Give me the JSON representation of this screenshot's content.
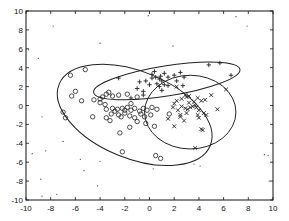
{
  "chart_data": {
    "type": "scatter",
    "title": "",
    "xlabel": "",
    "ylabel": "",
    "xlim": [
      -10,
      10
    ],
    "ylim": [
      -10,
      10
    ],
    "xticks": [
      "-10",
      "-8",
      "-6",
      "-4",
      "-2",
      "0",
      "2",
      "4",
      "6",
      "8",
      "10"
    ],
    "yticks": [
      "-10",
      "-8",
      "-6",
      "-4",
      "-2",
      "0",
      "2",
      "4",
      "6",
      "8",
      "10"
    ],
    "grid": false,
    "legend": null,
    "series": [
      {
        "name": "cluster-circles",
        "marker": "o",
        "points": [
          [
            -6.4,
            3.2
          ],
          [
            -5.2,
            3.8
          ],
          [
            -6.0,
            1.5
          ],
          [
            -6.3,
            1.0
          ],
          [
            -5.5,
            0.5
          ],
          [
            -7.0,
            -0.7
          ],
          [
            -4.5,
            0.6
          ],
          [
            -4.0,
            0.7
          ],
          [
            -3.8,
            0.9
          ],
          [
            -3.5,
            1.2
          ],
          [
            -3.3,
            1.4
          ],
          [
            -3.0,
            1.0
          ],
          [
            -2.5,
            1.1
          ],
          [
            -1.8,
            1.2
          ],
          [
            -1.5,
            0.2
          ],
          [
            -1.0,
            0.9
          ],
          [
            -4.0,
            0.3
          ],
          [
            -3.6,
            0.1
          ],
          [
            -3.5,
            -0.4
          ],
          [
            -3.0,
            -0.3
          ],
          [
            -2.8,
            -0.6
          ],
          [
            -2.6,
            -0.4
          ],
          [
            -2.2,
            -0.3
          ],
          [
            -2.0,
            -0.5
          ],
          [
            -1.8,
            -0.2
          ],
          [
            -1.5,
            -0.5
          ],
          [
            -1.2,
            -0.3
          ],
          [
            -0.8,
            -0.6
          ],
          [
            -0.5,
            -0.3
          ],
          [
            -0.2,
            -0.5
          ],
          [
            0.2,
            -0.2
          ],
          [
            0.6,
            -0.4
          ],
          [
            -3.1,
            -0.9
          ],
          [
            -2.5,
            -1.0
          ],
          [
            -2.3,
            -1.2
          ],
          [
            -2.0,
            -0.8
          ],
          [
            -1.6,
            -1.1
          ],
          [
            -1.2,
            -1.3
          ],
          [
            -0.7,
            -0.9
          ],
          [
            -0.4,
            -1.2
          ],
          [
            0.1,
            -1.0
          ],
          [
            -3.5,
            -1.3
          ],
          [
            -3.2,
            -1.6
          ],
          [
            -2.4,
            -2.9
          ],
          [
            -1.6,
            -2.3
          ],
          [
            -1.0,
            -1.7
          ],
          [
            -0.3,
            -1.9
          ],
          [
            0.4,
            -2.2
          ],
          [
            -4.6,
            -1.2
          ],
          [
            -2.2,
            -4.9
          ],
          [
            0.5,
            -5.3
          ],
          [
            0.9,
            -5.6
          ],
          [
            1.6,
            -0.9
          ],
          [
            -6.8,
            -1.3
          ]
        ]
      },
      {
        "name": "cluster-plus",
        "marker": "+",
        "points": [
          [
            -2.5,
            2.9
          ],
          [
            -1.0,
            1.8
          ],
          [
            -0.5,
            1.5
          ],
          [
            -0.3,
            2.6
          ],
          [
            0.0,
            2.2
          ],
          [
            0.2,
            2.9
          ],
          [
            0.5,
            3.0
          ],
          [
            0.8,
            2.8
          ],
          [
            1.0,
            2.6
          ],
          [
            0.6,
            2.3
          ],
          [
            0.8,
            2.0
          ],
          [
            1.2,
            2.2
          ],
          [
            -0.8,
            2.5
          ],
          [
            -0.5,
            1.1
          ],
          [
            -1.5,
            0.8
          ],
          [
            1.5,
            3.0
          ],
          [
            2.0,
            3.2
          ],
          [
            2.5,
            3.5
          ],
          [
            2.7,
            2.1
          ],
          [
            0.2,
            3.3
          ],
          [
            0.4,
            3.6
          ],
          [
            1.2,
            3.4
          ],
          [
            0.9,
            3.1
          ],
          [
            4.8,
            4.3
          ],
          [
            5.7,
            4.5
          ],
          [
            6.6,
            3.2
          ],
          [
            2.8,
            3.0
          ],
          [
            2.2,
            2.6
          ],
          [
            1.5,
            2.1
          ],
          [
            1.0,
            1.6
          ]
        ]
      },
      {
        "name": "cluster-x",
        "marker": "x",
        "points": [
          [
            1.9,
            -0.2
          ],
          [
            2.2,
            0.5
          ],
          [
            2.6,
            0.7
          ],
          [
            2.9,
            1.1
          ],
          [
            3.0,
            0.9
          ],
          [
            3.2,
            1.0
          ],
          [
            3.6,
            0.4
          ],
          [
            3.9,
            0.8
          ],
          [
            4.2,
            0.5
          ],
          [
            4.5,
            0.6
          ],
          [
            5.0,
            1.1
          ],
          [
            5.5,
            -0.4
          ],
          [
            2.0,
            0.2
          ],
          [
            2.3,
            -0.5
          ],
          [
            2.6,
            -0.1
          ],
          [
            2.9,
            -0.3
          ],
          [
            3.1,
            -0.4
          ],
          [
            3.3,
            -0.2
          ],
          [
            3.5,
            -0.1
          ],
          [
            3.8,
            -0.2
          ],
          [
            4.0,
            -0.5
          ],
          [
            4.4,
            -0.8
          ],
          [
            4.6,
            -1.0
          ],
          [
            3.0,
            -0.8
          ],
          [
            2.5,
            -1.0
          ],
          [
            1.5,
            -1.4
          ],
          [
            2.5,
            -1.2
          ],
          [
            2.8,
            -1.6
          ],
          [
            2.0,
            -2.2
          ],
          [
            3.9,
            -1.0
          ],
          [
            4.0,
            -1.3
          ],
          [
            4.2,
            -2.5
          ],
          [
            4.3,
            -2.6
          ],
          [
            3.7,
            -4.5
          ],
          [
            3.7,
            0.0
          ],
          [
            2.2,
            2.0
          ],
          [
            6.2,
            1.7
          ],
          [
            3.2,
            0.3
          ]
        ]
      },
      {
        "name": "noise",
        "marker": ".",
        "points": [
          [
            -7.8,
            8.4
          ],
          [
            -4.0,
            6.6
          ],
          [
            -0.1,
            9.5
          ],
          [
            -9.8,
            5.9
          ],
          [
            -9.0,
            5.0
          ],
          [
            7.0,
            9.4
          ],
          [
            7.9,
            8.4
          ],
          [
            1.9,
            6.3
          ],
          [
            -3.1,
            1.1
          ],
          [
            -8.7,
            -1.2
          ],
          [
            -9.5,
            -5.1
          ],
          [
            -8.4,
            -4.8
          ],
          [
            -5.6,
            -5.7
          ],
          [
            -4.0,
            -5.9
          ],
          [
            -8.8,
            -7.8
          ],
          [
            -7.0,
            -3.8
          ],
          [
            -4.2,
            -8.5
          ],
          [
            -7.5,
            -9.4
          ],
          [
            -8.7,
            -9.6
          ],
          [
            -0.8,
            -9.8
          ],
          [
            9.3,
            -5.2
          ],
          [
            9.6,
            -5.3
          ],
          [
            3.6,
            -6.2
          ],
          [
            4.1,
            -6.4
          ],
          [
            9.7,
            -8.0
          ],
          [
            0.3,
            -6.7
          ],
          [
            -5.3,
            -6.9
          ]
        ]
      }
    ],
    "ellipses": [
      {
        "name": "ellipse-circles",
        "cx": -1.2,
        "cy": -1.0,
        "rx": 6.6,
        "ry": 4.6,
        "angle_deg": -22
      },
      {
        "name": "ellipse-plus",
        "cx": 1.4,
        "cy": 2.6,
        "rx": 6.0,
        "ry": 1.6,
        "angle_deg": 9
      },
      {
        "name": "ellipse-x",
        "cx": 3.3,
        "cy": -0.7,
        "rx": 3.7,
        "ry": 3.9,
        "angle_deg": 0
      }
    ]
  }
}
